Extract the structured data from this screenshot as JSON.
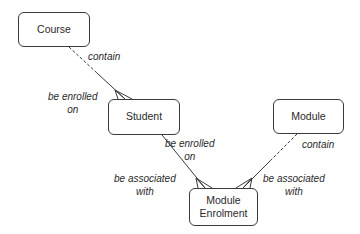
{
  "diagram": {
    "type": "entity-relationship",
    "entities": [
      {
        "id": "course",
        "label": "Course"
      },
      {
        "id": "student",
        "label": "Student"
      },
      {
        "id": "module",
        "label": "Module"
      },
      {
        "id": "module_enrolment",
        "label": "Module\nEnrolment",
        "line1": "Module",
        "line2": "Enrolment"
      }
    ],
    "relationships": [
      {
        "from": "course",
        "to": "student",
        "from_label": "contain",
        "to_label_line1": "be enrolled",
        "to_label_line2": "on",
        "optional_from": true,
        "many_at": "student"
      },
      {
        "from": "student",
        "to": "module_enrolment",
        "from_label_line1": "be enrolled",
        "from_label_line2": "on",
        "to_label_line1": "be associated",
        "to_label_line2": "with",
        "optional_from": false,
        "many_at": "module_enrolment"
      },
      {
        "from": "module",
        "to": "module_enrolment",
        "from_label": "contain",
        "to_label_line1": "be associated",
        "to_label_line2": "with",
        "optional_from": true,
        "many_at": "module_enrolment"
      }
    ],
    "colors": {
      "line": "#3a3a3a",
      "box_border": "#3a3a3a",
      "text": "#2a2a2a",
      "background": "#ffffff"
    }
  }
}
